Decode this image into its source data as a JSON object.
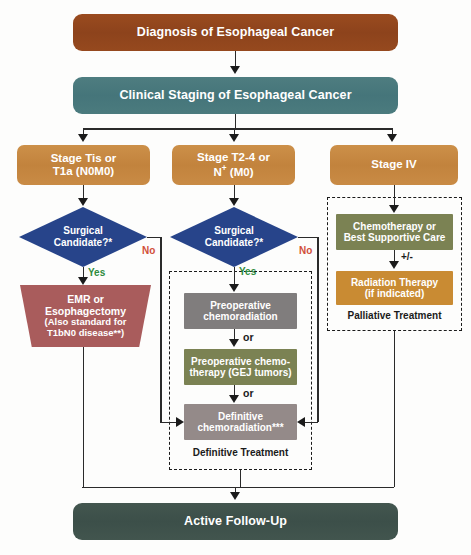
{
  "nodes": {
    "diagnosis": "Diagnosis of Esophageal Cancer",
    "staging": "Clinical Staging of Esophageal Cancer",
    "stage_1_l1": "Stage Tis or",
    "stage_1_l2": "T1a (N0M0)",
    "stage_2_l1": "Stage T2-4 or",
    "stage_2_l2": "N",
    "stage_2_l2_sup": "+",
    "stage_2_l2_rest": " (M0)",
    "stage_3": "Stage  IV",
    "decision_1_l1": "Surgical",
    "decision_1_l2": "Candidate?*",
    "decision_2_l1": "Surgical",
    "decision_2_l2": "Candidate?*",
    "emr_l1": "EMR or",
    "emr_l2": "Esophagectomy",
    "emr_l3": "(Also standard for",
    "emr_l4": "T1bN0 disease**)",
    "preop_chemoradiation_l1": "Preoperative",
    "preop_chemoradiation_l2": "chemoradiation",
    "preop_chemo_l1": "Preoperative chemo-",
    "preop_chemo_l2": "therapy (GEJ tumors)",
    "definitive_l1": "Definitive",
    "definitive_l2": "chemoradiation***",
    "chemo_bsc_l1": "Chemotherapy or",
    "chemo_bsc_l2": "Best Supportive Care",
    "radiation_l1": "Radiation Therapy",
    "radiation_l2": "(if indicated)",
    "followup": "Active Follow-Up"
  },
  "group_labels": {
    "definitive_treatment": "Definitive Treatment",
    "palliative_treatment": "Palliative Treatment"
  },
  "edge_labels": {
    "yes_left": "Yes",
    "no_left": "No",
    "yes_middle": "Yes",
    "no_middle": "No",
    "or_1": "or",
    "or_2": "or",
    "plus_minus": "+/-"
  },
  "colors": {
    "diagnosis_box": "#8d431c",
    "staging_box": "#45757a",
    "stage_box": "#c2833d",
    "decision_diamond": "#27448a",
    "emr_box": "#a95c5c",
    "gray_box": "#807d7d",
    "olive_box": "#7b8253",
    "mauve_box": "#948a89",
    "radiation_box": "#c98b33",
    "followup_box": "#3c4f49",
    "yes_label": "#2e8b3d",
    "no_label": "#d1503a",
    "connector": "#2a2a2a",
    "background": "#fdfdfc"
  }
}
